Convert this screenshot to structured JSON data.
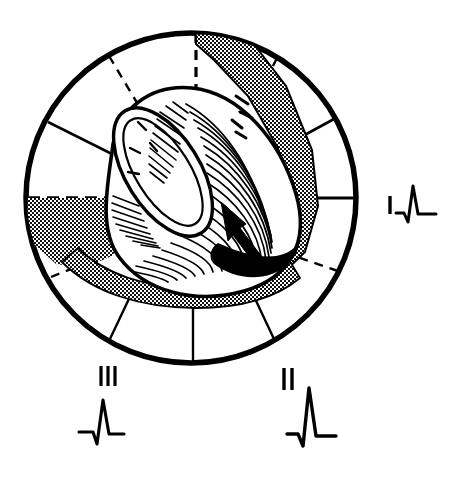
{
  "figure": {
    "background_color": "#ffffff",
    "ink_color": "#000000"
  },
  "circle": {
    "name": "frontal-plane-sector-circle",
    "center_x": 191,
    "center_y": 198,
    "radius": 165,
    "stroke_width": 5
  },
  "sector_lines": [
    {
      "angle_deg": 180,
      "style": "dashed",
      "inner_r": 0,
      "outer_r": 165
    },
    {
      "angle_deg": 0,
      "style": "solid",
      "inner_r": 0,
      "outer_r": 165
    },
    {
      "angle_deg": 150,
      "style": "solid",
      "inner_r": 88,
      "outer_r": 165
    },
    {
      "angle_deg": 120,
      "style": "dashed",
      "inner_r": 78,
      "outer_r": 165
    },
    {
      "angle_deg": 90,
      "style": "dashed",
      "inner_r": 72,
      "outer_r": 165
    },
    {
      "angle_deg": 60,
      "style": "dashed",
      "inner_r": 90,
      "outer_r": 165
    },
    {
      "angle_deg": 30,
      "style": "solid",
      "inner_r": 96,
      "outer_r": 165
    },
    {
      "angle_deg": 210,
      "style": "dashed",
      "inner_r": 96,
      "outer_r": 165
    },
    {
      "angle_deg": 240,
      "style": "solid",
      "inner_r": 96,
      "outer_r": 165
    },
    {
      "angle_deg": 270,
      "style": "solid",
      "inner_r": 96,
      "outer_r": 165
    },
    {
      "angle_deg": 300,
      "style": "solid",
      "inner_r": 96,
      "outer_r": 165
    },
    {
      "angle_deg": 330,
      "style": "dashed",
      "inner_r": 100,
      "outer_r": 165
    }
  ],
  "heart": {
    "name": "heart-ventricle-cutaway",
    "description": "Left ventricle drawn in cutaway with hatched myocardial wall and open ventricular cavity at upper left",
    "hatching": "fine parallel line shading",
    "cavity_label": "ventricular-cavity"
  },
  "infarct": {
    "shaded_band_label": "infarcted-myocardium-stipple-band",
    "shaded_pattern": "cross-hatch stipple",
    "core_label": "transmural-infarct-core",
    "core_fill": "#000000",
    "arrow_label": "infarct-pointer-arrow"
  },
  "leads": [
    {
      "id": "lead-I",
      "label": "I",
      "tick_count": 1,
      "label_x": 388,
      "label_y": 210,
      "ecg_x": 396,
      "ecg_y": 186,
      "ecg_scale": 0.62,
      "ecg_description": "small q dip, modest R wave, return to baseline"
    },
    {
      "id": "lead-II",
      "label": "II",
      "tick_count": 2,
      "label_x": 286,
      "label_y": 382,
      "ecg_x": 286,
      "ecg_y": 383,
      "ecg_scale": 1.0,
      "ecg_description": "tall R wave with deep S, most positive deflection"
    },
    {
      "id": "lead-III",
      "label": "III",
      "tick_count": 3,
      "label_x": 99,
      "label_y": 382,
      "ecg_x": 78,
      "ecg_y": 395,
      "ecg_scale": 0.82,
      "ecg_description": "small q, tall R wave, brief S, back to baseline"
    }
  ]
}
